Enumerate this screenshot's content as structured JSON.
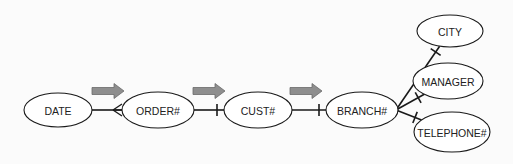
{
  "diagram": {
    "type": "functional-dependency-diagram",
    "colors": {
      "background": "#fbfbfb",
      "stroke": "#1a1a1a",
      "arrow_fill": "#8e8e8e",
      "arrow_stroke": "#6a6a6a"
    },
    "nodes": [
      {
        "id": "date",
        "label": "DATE",
        "cx": 58,
        "cy": 110,
        "rx": 34,
        "ry": 17
      },
      {
        "id": "order",
        "label": "ORDER#",
        "cx": 158,
        "cy": 110,
        "rx": 36,
        "ry": 18
      },
      {
        "id": "cust",
        "label": "CUST#",
        "cx": 258,
        "cy": 110,
        "rx": 34,
        "ry": 18
      },
      {
        "id": "branch",
        "label": "BRANCH#",
        "cx": 362,
        "cy": 110,
        "rx": 36,
        "ry": 18
      },
      {
        "id": "city",
        "label": "CITY",
        "cx": 450,
        "cy": 31,
        "rx": 33,
        "ry": 16
      },
      {
        "id": "manager",
        "label": "MANAGER",
        "cx": 448,
        "cy": 81,
        "rx": 35,
        "ry": 18
      },
      {
        "id": "telephone",
        "label": "TELEPHONE#",
        "cx": 452,
        "cy": 132,
        "rx": 38,
        "ry": 20
      }
    ],
    "edges": [
      {
        "from": "date",
        "to": "order",
        "end_marker": "crowfoot"
      },
      {
        "from": "order",
        "to": "cust",
        "end_marker": "bar"
      },
      {
        "from": "cust",
        "to": "branch",
        "end_marker": "bar"
      },
      {
        "from": "branch",
        "to": "city",
        "end_marker": "bar"
      },
      {
        "from": "branch",
        "to": "manager",
        "end_marker": "bar"
      },
      {
        "from": "branch",
        "to": "telephone",
        "end_marker": "bar"
      }
    ],
    "direction_arrows": [
      {
        "id": "arrow-1",
        "x": 92,
        "y": 91
      },
      {
        "id": "arrow-2",
        "x": 193,
        "y": 91
      },
      {
        "id": "arrow-3",
        "x": 290,
        "y": 91
      }
    ]
  }
}
